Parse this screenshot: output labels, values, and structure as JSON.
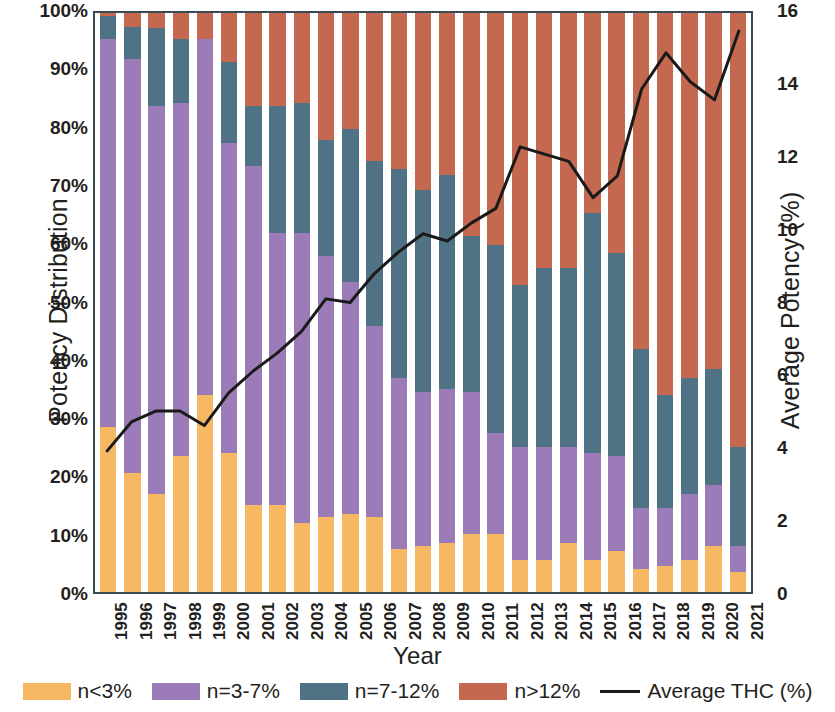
{
  "chart_data": {
    "type": "bar",
    "subtype": "stacked-bar-with-line",
    "title": "",
    "xlabel": "Year",
    "ylabel": "Potency Distribution",
    "ylabel_secondary": "Average Potency (%)",
    "grid": false,
    "legend_position": "bottom",
    "ylim": [
      0,
      100
    ],
    "ylim_secondary": [
      0,
      16
    ],
    "ytick_labels": [
      "100%",
      "90%",
      "80%",
      "70%",
      "60%",
      "50%",
      "40%",
      "30%",
      "20%",
      "10%",
      "0%"
    ],
    "ytick_values": [
      100,
      90,
      80,
      70,
      60,
      50,
      40,
      30,
      20,
      10,
      0
    ],
    "ytick_labels_secondary": [
      "16",
      "14",
      "12",
      "10",
      "8",
      "6",
      "4",
      "2",
      "0"
    ],
    "ytick_values_secondary": [
      16,
      14,
      12,
      10,
      8,
      6,
      4,
      2,
      0
    ],
    "categories": [
      "1995",
      "1996",
      "1997",
      "1998",
      "1999",
      "2000",
      "2001",
      "2002",
      "2003",
      "2004",
      "2005",
      "2006",
      "2007",
      "2008",
      "2009",
      "2010",
      "2011",
      "2012",
      "2013",
      "2014",
      "2015",
      "2016",
      "2017",
      "2018",
      "2019",
      "2020",
      "2021"
    ],
    "series": [
      {
        "name": "n<3%",
        "color": "#f6b862",
        "values": [
          28.5,
          20.5,
          17.0,
          23.5,
          34.0,
          24.0,
          15.0,
          15.0,
          12.0,
          13.0,
          13.5,
          13.0,
          7.5,
          8.0,
          8.5,
          10.0,
          10.0,
          5.5,
          5.5,
          8.5,
          5.5,
          7.0,
          4.0,
          4.5,
          5.5,
          8.0,
          3.5
        ]
      },
      {
        "name": "n=3-7%",
        "color": "#9b7cb8",
        "values": [
          67.0,
          71.5,
          67.0,
          61.0,
          61.5,
          53.5,
          58.5,
          47.0,
          50.0,
          45.0,
          40.0,
          33.0,
          29.5,
          26.5,
          26.5,
          24.5,
          17.5,
          19.5,
          19.5,
          16.5,
          18.5,
          16.5,
          10.5,
          10.0,
          11.5,
          10.5,
          4.5
        ]
      },
      {
        "name": "n=7-12%",
        "color": "#4f7384",
        "values": [
          4.0,
          5.5,
          13.5,
          11.0,
          0.0,
          14.0,
          10.5,
          22.0,
          22.5,
          20.0,
          26.5,
          28.5,
          36.0,
          35.0,
          37.0,
          27.0,
          32.5,
          28.0,
          31.0,
          31.0,
          41.5,
          35.0,
          27.5,
          19.5,
          20.0,
          20.0,
          17.0
        ]
      },
      {
        "name": "n>12%",
        "color": "#c4684f",
        "values": [
          0.5,
          2.5,
          2.5,
          4.5,
          4.5,
          8.5,
          16.0,
          16.0,
          15.5,
          22.0,
          20.0,
          25.5,
          27.0,
          30.5,
          28.0,
          38.5,
          40.0,
          47.0,
          44.0,
          44.0,
          34.5,
          41.5,
          58.0,
          66.0,
          63.0,
          61.5,
          75.0
        ]
      }
    ],
    "line_series": {
      "name": "Average THC (%)",
      "color": "#1a1a1a",
      "axis": "secondary",
      "values": [
        3.9,
        4.7,
        5.0,
        5.0,
        4.6,
        5.5,
        6.1,
        6.6,
        7.2,
        8.1,
        8.0,
        8.8,
        9.4,
        9.9,
        9.7,
        10.2,
        10.6,
        12.3,
        12.1,
        11.9,
        10.9,
        11.5,
        13.9,
        14.9,
        14.1,
        13.6,
        15.5
      ]
    }
  },
  "axes": {
    "left_title": "Potency Distribution",
    "right_title": "Average Potency (%)",
    "bottom_title": "Year"
  },
  "legend": {
    "items": [
      {
        "label": "n<3%",
        "swatch": "legend-swatch-orange"
      },
      {
        "label": "n=3-7%",
        "swatch": "legend-swatch-purple"
      },
      {
        "label": "n=7-12%",
        "swatch": "legend-swatch-teal"
      },
      {
        "label": "n>12%",
        "swatch": "legend-swatch-salmon"
      },
      {
        "label": "Average THC (%)",
        "swatch": "legend-line-black"
      }
    ]
  }
}
